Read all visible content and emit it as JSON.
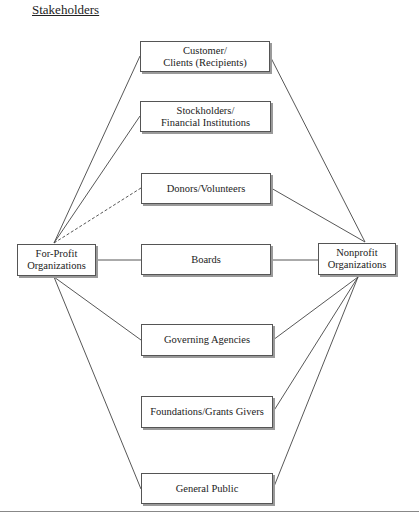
{
  "title": "Stakeholders",
  "nodes": {
    "for_profit": "For-Profit\nOrganizations",
    "nonprofit": "Nonprofit\nOrganizations"
  },
  "stakeholders": [
    {
      "id": "customers",
      "label": "Customer/\nClients (Recipients)"
    },
    {
      "id": "stockholders",
      "label": "Stockholders/\nFinancial Institutions"
    },
    {
      "id": "donors",
      "label": "Donors/Volunteers"
    },
    {
      "id": "boards",
      "label": "Boards"
    },
    {
      "id": "governing",
      "label": "Governing Agencies"
    },
    {
      "id": "foundations",
      "label": "Foundations/Grants Givers"
    },
    {
      "id": "public",
      "label": "General Public"
    }
  ],
  "edges_note": "Solid lines connect both organization types to stakeholders; dashed line from For-Profit to Donors/Volunteers."
}
